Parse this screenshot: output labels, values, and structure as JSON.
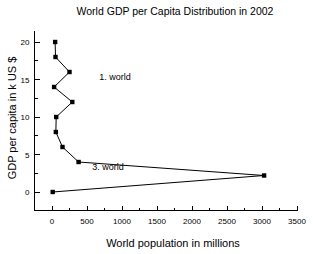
{
  "chart_data": {
    "type": "line",
    "title": "World GDP per Capita Distribution in 2002",
    "xlabel": "World population in millions",
    "ylabel": "GDP per capita in k US $",
    "xlim": [
      -250,
      3500
    ],
    "ylim": [
      -2.5,
      21.5
    ],
    "xticks": [
      0,
      500,
      1000,
      1500,
      2000,
      2500,
      3000,
      3500
    ],
    "xtick_labels": [
      "0",
      "500",
      "1000",
      "1500",
      "2000",
      "2500",
      "3000",
      "3500"
    ],
    "yticks": [
      0,
      5,
      10,
      15,
      20
    ],
    "ytick_labels": [
      "0",
      "5",
      "10",
      "15",
      "20"
    ],
    "x_minor_interval": 250,
    "y_minor_interval": 2.5,
    "grid": false,
    "legend": null,
    "marker": "filled-square",
    "marker_color": "#000000",
    "line_color": "#000000",
    "series": [
      {
        "name": "world-gdp-distribution",
        "points": [
          {
            "x": 45,
            "y": 20.0
          },
          {
            "x": 50,
            "y": 18.0
          },
          {
            "x": 250,
            "y": 16.0
          },
          {
            "x": 30,
            "y": 14.0
          },
          {
            "x": 290,
            "y": 12.0
          },
          {
            "x": 60,
            "y": 10.0
          },
          {
            "x": 55,
            "y": 8.0
          },
          {
            "x": 150,
            "y": 6.0
          },
          {
            "x": 380,
            "y": 4.0
          },
          {
            "x": 3030,
            "y": 2.2
          },
          {
            "x": 10,
            "y": 0.0
          }
        ]
      }
    ],
    "annotations": [
      {
        "text": "1. world",
        "x": 900,
        "y": 15.0
      },
      {
        "text": "3. world",
        "x": 800,
        "y": 2.9
      }
    ]
  }
}
